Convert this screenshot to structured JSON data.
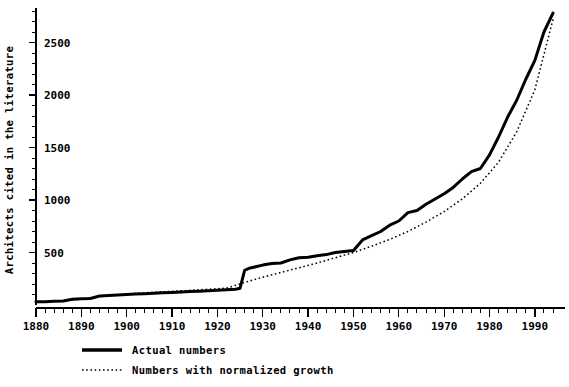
{
  "chart_data": {
    "type": "line",
    "title": "",
    "xlabel": "",
    "ylabel": "Architects cited in the literature",
    "xlim": [
      1880,
      1994
    ],
    "ylim": [
      0,
      2900
    ],
    "grid": false,
    "legend_position": "bottom-left",
    "x_ticks": [
      1880,
      1890,
      1900,
      1910,
      1920,
      1930,
      1940,
      1950,
      1960,
      1970,
      1980,
      1990
    ],
    "x_tick_labels": [
      "1880",
      "1890",
      "1900",
      "1910",
      "1920",
      "1930",
      "1940",
      "1950",
      "1960",
      "1970",
      "1980",
      "1990"
    ],
    "x_minor_tick_step": 2,
    "y_ticks": [
      500,
      1000,
      1500,
      2000,
      2500
    ],
    "y_tick_labels": [
      "500",
      "1000",
      "1500",
      "2000",
      "2500"
    ],
    "y_minor_tick_step": 100,
    "series": [
      {
        "name": "Actual numbers",
        "style": "solid",
        "x": [
          1880,
          1882,
          1884,
          1886,
          1888,
          1890,
          1892,
          1894,
          1896,
          1898,
          1900,
          1902,
          1904,
          1906,
          1908,
          1910,
          1912,
          1914,
          1916,
          1918,
          1920,
          1922,
          1924,
          1925,
          1926,
          1927,
          1928,
          1930,
          1932,
          1934,
          1936,
          1938,
          1940,
          1942,
          1944,
          1946,
          1948,
          1950,
          1952,
          1954,
          1956,
          1958,
          1960,
          1962,
          1964,
          1966,
          1968,
          1970,
          1972,
          1974,
          1976,
          1978,
          1980,
          1982,
          1984,
          1986,
          1988,
          1990,
          1992,
          1994
        ],
        "values": [
          30,
          32,
          35,
          38,
          55,
          60,
          62,
          85,
          90,
          95,
          100,
          105,
          108,
          112,
          116,
          120,
          124,
          128,
          132,
          136,
          140,
          145,
          150,
          160,
          330,
          350,
          360,
          380,
          395,
          400,
          430,
          450,
          455,
          470,
          480,
          500,
          510,
          520,
          620,
          660,
          700,
          760,
          800,
          880,
          900,
          960,
          1010,
          1060,
          1120,
          1200,
          1270,
          1300,
          1430,
          1600,
          1790,
          1950,
          2150,
          2330,
          2600,
          2780
        ]
      },
      {
        "name": "Numbers with normalized growth",
        "style": "dotted",
        "x": [
          1886,
          1890,
          1894,
          1898,
          1902,
          1906,
          1910,
          1914,
          1918,
          1922,
          1926,
          1930,
          1934,
          1938,
          1942,
          1946,
          1950,
          1954,
          1958,
          1962,
          1966,
          1970,
          1974,
          1978,
          1982,
          1986,
          1990,
          1994
        ],
        "values": [
          40,
          55,
          80,
          95,
          110,
          122,
          130,
          140,
          150,
          160,
          215,
          265,
          310,
          355,
          400,
          450,
          500,
          560,
          625,
          700,
          790,
          890,
          1010,
          1160,
          1360,
          1650,
          2050,
          2720
        ]
      }
    ]
  },
  "legend": {
    "items": [
      {
        "label": "Actual numbers",
        "style": "solid"
      },
      {
        "label": "Numbers with normalized growth",
        "style": "dotted"
      }
    ]
  }
}
